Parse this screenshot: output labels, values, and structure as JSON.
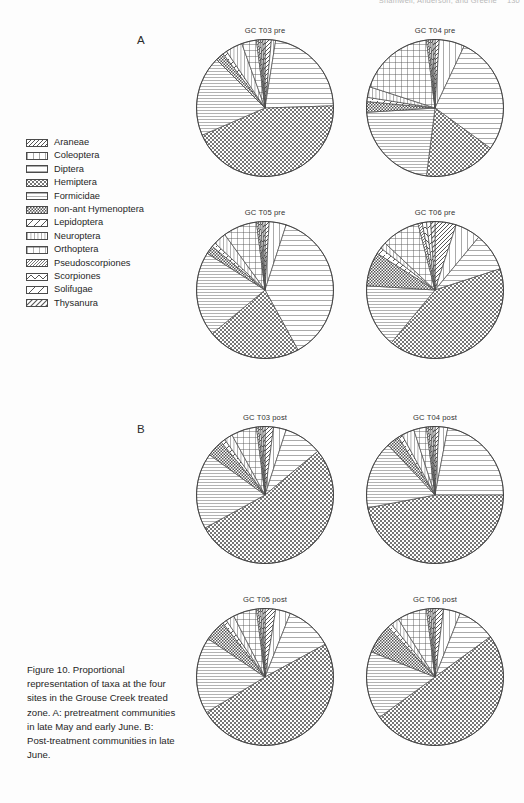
{
  "header": {
    "running_text": "Shamwell, Anderson, and Greene",
    "page_number": "130"
  },
  "panels": [
    {
      "letter": "A"
    },
    {
      "letter": "B"
    }
  ],
  "legend": {
    "items": [
      {
        "label": "Araneae",
        "pattern": "hatch-forward-dense"
      },
      {
        "label": "Coleoptera",
        "pattern": "vertical-wide"
      },
      {
        "label": "Diptera",
        "pattern": "horizontal-wide"
      },
      {
        "label": "Hemiptera",
        "pattern": "crosshatch-diagonal"
      },
      {
        "label": "Formicidae",
        "pattern": "horizontal-fine"
      },
      {
        "label": "non-ant Hymenoptera",
        "pattern": "checker-fine"
      },
      {
        "label": "Lepidoptera",
        "pattern": "hatch-back-wide"
      },
      {
        "label": "Neuroptera",
        "pattern": "vertical-fine"
      },
      {
        "label": "Orthoptera",
        "pattern": "grid-square"
      },
      {
        "label": "Pseudoscorpiones",
        "pattern": "hatch-forward-fine"
      },
      {
        "label": "Scorpiones",
        "pattern": "zigzag"
      },
      {
        "label": "Solifugae",
        "pattern": "hatch-back-sparse"
      },
      {
        "label": "Thysanura",
        "pattern": "hatch-forward-wide"
      }
    ]
  },
  "caption": {
    "text": "Figure 10. Proportional representation of taxa at the four sites in the Grouse Creek treated zone. A: pretreatment communities in late May and early June. B: Post-treatment communities in late June."
  },
  "chart_data": [
    {
      "type": "pie",
      "title": "GC T03 pre",
      "panel": "A",
      "labels": [
        "Araneae",
        "Coleoptera",
        "Diptera",
        "Hemiptera",
        "Formicidae",
        "non-ant Hymenoptera",
        "Lepidoptera",
        "Neuroptera",
        "Orthoptera",
        "Pseudoscorpiones",
        "Scorpiones",
        "Solifugae",
        "Thysanura"
      ],
      "values": [
        1.5,
        1.0,
        22.0,
        44.0,
        19.0,
        2.0,
        1.0,
        4.0,
        3.5,
        0.5,
        0.5,
        0.5,
        0.5
      ],
      "start_angle": -90,
      "direction": "clockwise"
    },
    {
      "type": "pie",
      "title": "GC T04 pre",
      "panel": "A",
      "labels": [
        "Araneae",
        "Coleoptera",
        "Diptera",
        "Hemiptera",
        "Formicidae",
        "non-ant Hymenoptera",
        "Lepidoptera",
        "Neuroptera",
        "Orthoptera",
        "Pseudoscorpiones",
        "Scorpiones",
        "Solifugae",
        "Thysanura"
      ],
      "values": [
        1.0,
        6.0,
        28.0,
        17.0,
        22.0,
        2.5,
        1.0,
        2.5,
        18.0,
        0.5,
        0.5,
        0.5,
        0.5
      ],
      "start_angle": -90,
      "direction": "clockwise"
    },
    {
      "type": "pie",
      "title": "GC T05 pre",
      "panel": "A",
      "labels": [
        "Araneae",
        "Coleoptera",
        "Diptera",
        "Hemiptera",
        "Formicidae",
        "non-ant Hymenoptera",
        "Lepidoptera",
        "Neuroptera",
        "Orthoptera",
        "Pseudoscorpiones",
        "Scorpiones",
        "Solifugae",
        "Thysanura"
      ],
      "values": [
        1.0,
        4.0,
        37.0,
        22.0,
        20.0,
        2.0,
        1.0,
        3.0,
        8.0,
        0.5,
        0.5,
        0.5,
        0.5
      ],
      "start_angle": -90,
      "direction": "clockwise"
    },
    {
      "type": "pie",
      "title": "GC T06 pre",
      "panel": "A",
      "labels": [
        "Araneae",
        "Coleoptera",
        "Diptera",
        "Hemiptera",
        "Formicidae",
        "non-ant Hymenoptera",
        "Lepidoptera",
        "Neuroptera",
        "Orthoptera",
        "Pseudoscorpiones",
        "Scorpiones",
        "Solifugae",
        "Thysanura"
      ],
      "values": [
        5.0,
        6.0,
        9.0,
        41.0,
        15.0,
        8.0,
        1.5,
        1.5,
        9.0,
        1.0,
        1.0,
        1.0,
        1.0
      ],
      "start_angle": -90,
      "direction": "clockwise"
    },
    {
      "type": "pie",
      "title": "GC T03 post",
      "panel": "B",
      "labels": [
        "Araneae",
        "Coleoptera",
        "Diptera",
        "Hemiptera",
        "Formicidae",
        "non-ant Hymenoptera",
        "Lepidoptera",
        "Neuroptera",
        "Orthoptera",
        "Pseudoscorpiones",
        "Scorpiones",
        "Solifugae",
        "Thysanura"
      ],
      "values": [
        2.0,
        3.0,
        9.0,
        53.0,
        18.0,
        4.0,
        1.0,
        2.0,
        6.0,
        0.5,
        0.5,
        0.5,
        0.5
      ],
      "start_angle": -90,
      "direction": "clockwise"
    },
    {
      "type": "pie",
      "title": "GC T04 post",
      "panel": "B",
      "labels": [
        "Araneae",
        "Coleoptera",
        "Diptera",
        "Hemiptera",
        "Formicidae",
        "non-ant Hymenoptera",
        "Lepidoptera",
        "Neuroptera",
        "Orthoptera",
        "Pseudoscorpiones",
        "Scorpiones",
        "Solifugae",
        "Thysanura"
      ],
      "values": [
        1.0,
        2.0,
        22.0,
        47.0,
        16.0,
        3.0,
        1.0,
        3.0,
        3.0,
        0.5,
        0.5,
        0.5,
        0.5
      ],
      "start_angle": -90,
      "direction": "clockwise"
    },
    {
      "type": "pie",
      "title": "GC T05 post",
      "panel": "B",
      "labels": [
        "Araneae",
        "Coleoptera",
        "Diptera",
        "Hemiptera",
        "Formicidae",
        "non-ant Hymenoptera",
        "Lepidoptera",
        "Neuroptera",
        "Orthoptera",
        "Pseudoscorpiones",
        "Scorpiones",
        "Solifugae",
        "Thysanura"
      ],
      "values": [
        2.5,
        3.5,
        11.0,
        49.0,
        18.0,
        5.0,
        1.0,
        2.0,
        5.5,
        0.5,
        0.5,
        0.5,
        0.5
      ],
      "start_angle": -90,
      "direction": "clockwise"
    },
    {
      "type": "pie",
      "title": "GC T06 post",
      "panel": "B",
      "labels": [
        "Araneae",
        "Coleoptera",
        "Diptera",
        "Hemiptera",
        "Formicidae",
        "non-ant Hymenoptera",
        "Lepidoptera",
        "Neuroptera",
        "Orthoptera",
        "Pseudoscorpiones",
        "Scorpiones",
        "Solifugae",
        "Thysanura"
      ],
      "values": [
        2.0,
        4.0,
        9.0,
        50.0,
        16.0,
        7.0,
        1.0,
        2.0,
        7.0,
        0.5,
        0.5,
        0.5,
        0.5
      ],
      "start_angle": -90,
      "direction": "clockwise"
    }
  ],
  "layout": {
    "pie_positions": [
      {
        "left": 195,
        "top": 26,
        "size": 140
      },
      {
        "left": 365,
        "top": 26,
        "size": 140
      },
      {
        "left": 195,
        "top": 208,
        "size": 140
      },
      {
        "left": 365,
        "top": 208,
        "size": 140
      },
      {
        "left": 195,
        "top": 413,
        "size": 140
      },
      {
        "left": 365,
        "top": 413,
        "size": 140
      },
      {
        "left": 195,
        "top": 595,
        "size": 140
      },
      {
        "left": 365,
        "top": 595,
        "size": 140
      }
    ]
  },
  "colors": {
    "ink": "#2b2b2b",
    "pattern_stroke": "#555555",
    "background": "#ffffff"
  }
}
